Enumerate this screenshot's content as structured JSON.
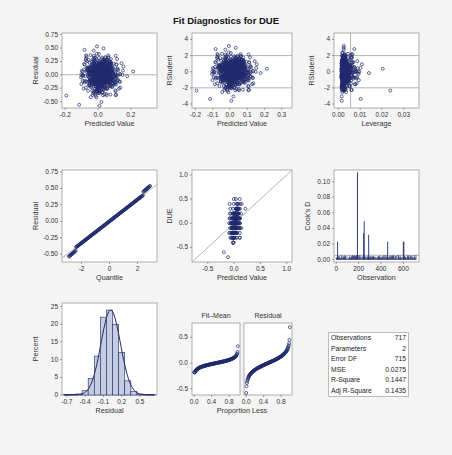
{
  "title": "Fit Diagnostics for DUE",
  "colors": {
    "marker": "#1f2a6b",
    "ref": "#9aa0a6",
    "bar": "#c5cde0",
    "frame": "#9c9c9c",
    "bg": "#f4f4f4"
  },
  "stats": [
    {
      "label": "Observations",
      "value": "717"
    },
    {
      "label": "Parameters",
      "value": "2"
    },
    {
      "label": "Error DF",
      "value": "715"
    },
    {
      "label": "MSE",
      "value": "0.0275"
    },
    {
      "label": "R-Square",
      "value": "0.1447"
    },
    {
      "label": "Adj R-Square",
      "value": "0.1435"
    }
  ],
  "chart_data": [
    {
      "type": "scatter",
      "title": "Residual vs Predicted",
      "xlabel": "Predicted Value",
      "ylabel": "Residual",
      "xticks": [
        "-0.2",
        "0.0",
        "0.2"
      ],
      "yticks": [
        "0.75",
        "0.50",
        "0.25",
        "0.00",
        "-0.25",
        "-0.50"
      ],
      "xlim": [
        -0.22,
        0.36
      ],
      "ylim": [
        -0.62,
        0.78
      ],
      "reflines_y": [
        0
      ]
    },
    {
      "type": "scatter",
      "title": "RStudent vs Predicted",
      "xlabel": "Predicted Value",
      "ylabel": "RStudent",
      "xticks": [
        "-0.2",
        "-0.1",
        "0.0",
        "0.1",
        "0.2",
        "0.3"
      ],
      "yticks": [
        "4",
        "2",
        "0",
        "-2",
        "-4"
      ],
      "xlim": [
        -0.22,
        0.36
      ],
      "ylim": [
        -4.5,
        4.8
      ],
      "reflines_y": [
        2,
        -2
      ]
    },
    {
      "type": "scatter",
      "title": "RStudent vs Leverage",
      "xlabel": "Leverage",
      "ylabel": "RStudent",
      "xticks": [
        "0.00",
        "0.01",
        "0.02",
        "0.03"
      ],
      "yticks": [
        "4",
        "2",
        "0",
        "-2",
        "-4"
      ],
      "xlim": [
        -0.002,
        0.037
      ],
      "ylim": [
        -4.5,
        4.8
      ],
      "reflines_y": [
        2,
        -2
      ],
      "reflines_x": [
        0.0056
      ]
    },
    {
      "type": "scatter",
      "title": "Q-Q Plot of Residuals",
      "xlabel": "Quantile",
      "ylabel": "Residual",
      "xticks": [
        "-2",
        "0",
        "2"
      ],
      "yticks": [
        "0.75",
        "0.50",
        "0.25",
        "0.00",
        "-0.25",
        "-0.50"
      ],
      "xlim": [
        -3.4,
        3.4
      ],
      "ylim": [
        -0.62,
        0.78
      ]
    },
    {
      "type": "scatter",
      "title": "DUE vs Predicted",
      "xlabel": "Predicted Value",
      "ylabel": "DUE",
      "xticks": [
        "-0.5",
        "0.0",
        "0.5",
        "1.0"
      ],
      "yticks": [
        "1.0",
        "0.5",
        "0.0",
        "-0.5"
      ],
      "xlim": [
        -0.8,
        1.1
      ],
      "ylim": [
        -0.8,
        1.1
      ]
    },
    {
      "type": "bar",
      "title": "Cook's D",
      "xlabel": "Observation",
      "ylabel": "Cook's D",
      "xticks": [
        "0",
        "200",
        "400",
        "600"
      ],
      "yticks": [
        "0.10",
        "0.08",
        "0.06",
        "0.04",
        "0.02",
        "0.00"
      ],
      "xlim": [
        -20,
        740
      ],
      "ylim": [
        -0.003,
        0.115
      ],
      "spikes": [
        {
          "x": 12,
          "y": 0.023
        },
        {
          "x": 190,
          "y": 0.112
        },
        {
          "x": 245,
          "y": 0.034
        },
        {
          "x": 250,
          "y": 0.049
        },
        {
          "x": 290,
          "y": 0.032
        },
        {
          "x": 460,
          "y": 0.023
        },
        {
          "x": 600,
          "y": 0.023
        },
        {
          "x": 605,
          "y": 0.023
        }
      ],
      "reflines_y": [
        0.0056
      ]
    },
    {
      "type": "bar",
      "title": "Residual Histogram",
      "xlabel": "Residual",
      "ylabel": "Percent",
      "xticks": [
        "-0.7",
        "-0.4",
        "-0.1",
        "0.2",
        "0.5"
      ],
      "yticks": [
        "25",
        "20",
        "15",
        "10",
        "5",
        "0"
      ],
      "categories": [
        -0.7,
        -0.6,
        -0.5,
        -0.4,
        -0.3,
        -0.2,
        -0.1,
        0.0,
        0.1,
        0.2,
        0.3,
        0.4,
        0.5,
        0.6,
        0.7
      ],
      "values": [
        0.1,
        0.2,
        0.3,
        1.2,
        4.7,
        11,
        22,
        24,
        20,
        12,
        4,
        1,
        0.3,
        0.1,
        0.1
      ],
      "ylim": [
        0,
        26
      ]
    },
    {
      "type": "scatter",
      "title": "Residual-Fit Spread",
      "panels": [
        "Fit–Mean",
        "Residual"
      ],
      "xlabel": "Proportion Less",
      "xticks": [
        "0.0",
        "0.4",
        "0.8"
      ],
      "yticks": [
        "0.5",
        "0.0",
        "-0.5"
      ],
      "ylim": [
        -0.62,
        0.78
      ]
    }
  ]
}
